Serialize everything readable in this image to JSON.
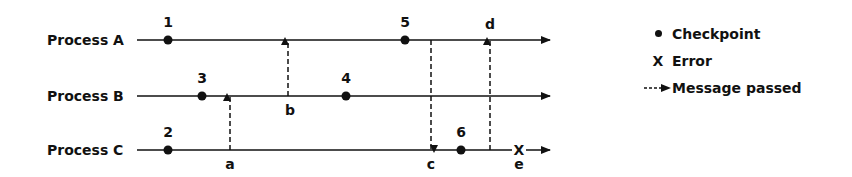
{
  "diagram": {
    "processes": [
      {
        "label": "Process A",
        "y": 40
      },
      {
        "label": "Process B",
        "y": 96
      },
      {
        "label": "Process C",
        "y": 150
      }
    ],
    "checkpoints": [
      {
        "label": "1",
        "process": "Process A",
        "x": 168
      },
      {
        "label": "2",
        "process": "Process C",
        "x": 168
      },
      {
        "label": "3",
        "process": "Process B",
        "x": 202
      },
      {
        "label": "4",
        "process": "Process B",
        "x": 346
      },
      {
        "label": "5",
        "process": "Process A",
        "x": 405
      },
      {
        "label": "6",
        "process": "Process C",
        "x": 461
      }
    ],
    "messages": [
      {
        "label": "a",
        "from": "Process C",
        "to": "Process B",
        "x": 230
      },
      {
        "label": "b",
        "from": "Process B",
        "to": "Process A",
        "x": 288
      },
      {
        "label": "c",
        "from": "Process A",
        "to": "Process C",
        "x": 431
      },
      {
        "label": "d",
        "from": "Process C",
        "to": "Process A",
        "x": 490
      }
    ],
    "error": {
      "label": "e",
      "process": "Process C",
      "x": 518,
      "symbol": "X"
    }
  },
  "legend": {
    "checkpoint": "Checkpoint",
    "error_symbol": "X",
    "error": "Error",
    "message": "Message passed"
  }
}
